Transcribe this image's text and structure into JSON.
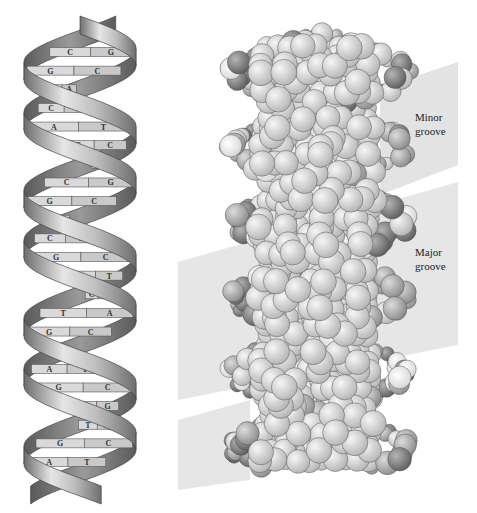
{
  "figure": {
    "left_panel": {
      "title": "Ribbon model of DNA double helix",
      "base_pairs": [
        {
          "left": "C",
          "right": "G"
        },
        {
          "left": "G",
          "right": "C"
        },
        {
          "left": "T",
          "right": "A"
        },
        {
          "left": "C",
          "right": "G"
        },
        {
          "left": "A",
          "right": "T"
        },
        {
          "left": "G",
          "right": "C"
        },
        {
          "left": "T",
          "right": "A"
        },
        {
          "left": "C",
          "right": "G"
        },
        {
          "left": "G",
          "right": "C"
        },
        {
          "left": "T",
          "right": "A"
        },
        {
          "left": "C",
          "right": "G"
        },
        {
          "left": "G",
          "right": "C"
        },
        {
          "left": "A",
          "right": "T"
        },
        {
          "left": "C",
          "right": "G"
        },
        {
          "left": "T",
          "right": "A"
        },
        {
          "left": "G",
          "right": "C"
        },
        {
          "left": "C",
          "right": "G"
        },
        {
          "left": "A",
          "right": "T"
        },
        {
          "left": "G",
          "right": "C"
        },
        {
          "left": "C",
          "right": "G"
        },
        {
          "left": "T",
          "right": "A"
        },
        {
          "left": "G",
          "right": "C"
        },
        {
          "left": "A",
          "right": "T"
        }
      ]
    },
    "right_panel": {
      "title": "Space-filling model of DNA",
      "labels": {
        "minor_groove_line1": "Minor",
        "minor_groove_line2": "groove",
        "major_groove_line1": "Major",
        "major_groove_line2": "groove"
      }
    },
    "colors": {
      "ribbon_light": "#e6e6e6",
      "ribbon_mid": "#a8a8a8",
      "ribbon_dark": "#6e6e6e",
      "base_fill": "#d4d4d4",
      "groove_band": "#e3e3e3",
      "atom_dark": "#7a7a7a",
      "atom_mid": "#a0a0a0",
      "atom_light": "#d8d8d8",
      "atom_white": "#f4f4f4"
    }
  }
}
